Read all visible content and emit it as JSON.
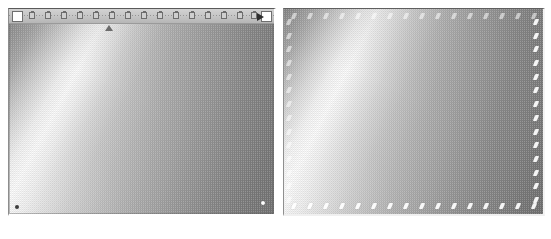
{
  "document": {
    "title": "Gradient Comparison Panels",
    "background_color": "#ffffff",
    "width": 551,
    "height": 239
  },
  "panels": [
    {
      "id": "left",
      "name": "Left gradient preview panel",
      "label": "Gradient preview (with ruler)",
      "x": 8,
      "y": 8,
      "width": 268,
      "height": 208,
      "border_color": "#5a5a5a",
      "has_ruler": true,
      "gradient": {
        "type": "diagonal-linear",
        "angle_deg": 118,
        "description": "Dithered grayscale diagonal band, bright from lower-left to upper-right, darkening toward bottom-right",
        "stops": [
          {
            "position_pct": 0,
            "color": "#8e8e8e"
          },
          {
            "position_pct": 9,
            "color": "#a9a9a9"
          },
          {
            "position_pct": 17,
            "color": "#d4d4d4"
          },
          {
            "position_pct": 23,
            "color": "#f2f2f2"
          },
          {
            "position_pct": 27,
            "color": "#fdfdfd"
          },
          {
            "position_pct": 31,
            "color": "#f0f0f0"
          },
          {
            "position_pct": 37,
            "color": "#d8d8d8"
          },
          {
            "position_pct": 44,
            "color": "#c3c3c3"
          },
          {
            "position_pct": 52,
            "color": "#b4b4b4"
          },
          {
            "position_pct": 62,
            "color": "#a6a6a6"
          },
          {
            "position_pct": 72,
            "color": "#999999"
          },
          {
            "position_pct": 82,
            "color": "#8d8d8d"
          },
          {
            "position_pct": 90,
            "color": "#848484"
          },
          {
            "position_pct": 100,
            "color": "#7d7d7d"
          }
        ],
        "dither": "ordered-checker-2px"
      },
      "ruler": {
        "name": "horizontal-ruler-strip",
        "height": 15,
        "background_color": "#c4c4c4",
        "start_marker": {
          "shape": "square",
          "color": "#ffffff",
          "x": 3
        },
        "end_marker": {
          "shape": "square",
          "color": "#ffffff"
        },
        "arrow_marker": {
          "shape": "triangle-right",
          "color": "#2e2e2e",
          "x": 248
        },
        "triangle_marker": {
          "shape": "triangle-up",
          "color": "#6c6c6c",
          "x": 96
        },
        "handle_color": "#cfcfcf",
        "handle_border_color": "#6d6d6d",
        "handle_positions": [
          20,
          36,
          52,
          68,
          84,
          100,
          116,
          132,
          148,
          164,
          180,
          196,
          212,
          228,
          242
        ]
      },
      "corner_markers": [
        {
          "name": "bottom-left-dot",
          "x": 6,
          "y": 196,
          "color": "#3c3c3c"
        },
        {
          "name": "bottom-right-dot",
          "x": 252,
          "y": 192,
          "color": "#ffffff"
        }
      ]
    },
    {
      "id": "right",
      "name": "Right gradient preview panel",
      "label": "Gradient preview (with edge ticks)",
      "x": 283,
      "y": 8,
      "width": 262,
      "height": 208,
      "border_color": "#5f5f5f",
      "has_ruler": false,
      "gradient": {
        "type": "diagonal-linear",
        "angle_deg": 117,
        "description": "Dithered grayscale diagonal band, bright from lower-left to upper-right, darkening toward bottom-right",
        "stops": [
          {
            "position_pct": 0,
            "color": "#909090"
          },
          {
            "position_pct": 8,
            "color": "#b0b0b0"
          },
          {
            "position_pct": 16,
            "color": "#dadada"
          },
          {
            "position_pct": 22,
            "color": "#f6f6f6"
          },
          {
            "position_pct": 26,
            "color": "#fefefe"
          },
          {
            "position_pct": 30,
            "color": "#f1f1f1"
          },
          {
            "position_pct": 37,
            "color": "#d9d9d9"
          },
          {
            "position_pct": 45,
            "color": "#c2c2c2"
          },
          {
            "position_pct": 53,
            "color": "#b2b2b2"
          },
          {
            "position_pct": 63,
            "color": "#a3a3a3"
          },
          {
            "position_pct": 73,
            "color": "#959595"
          },
          {
            "position_pct": 83,
            "color": "#8a8a8a"
          },
          {
            "position_pct": 92,
            "color": "#818181"
          },
          {
            "position_pct": 100,
            "color": "#797979"
          }
        ],
        "dither": "ordered-checker-2px"
      },
      "edge_ticks": {
        "name": "edge-tick-markers",
        "shape": "slash",
        "color": "#ffffff",
        "skew_deg": -22,
        "top_count": 16,
        "bottom_count": 16,
        "left_count": 14,
        "right_count": 14,
        "top_faint": true,
        "left_faint": true
      }
    }
  ]
}
